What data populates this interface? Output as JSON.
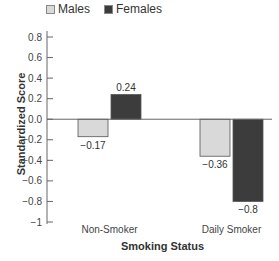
{
  "chart_data": {
    "type": "bar",
    "title": "",
    "xlabel": "Smoking Status",
    "ylabel": "Standardized Score",
    "categories": [
      "Non-Smoker",
      "Daily Smoker"
    ],
    "series": [
      {
        "name": "Males",
        "values": [
          -0.17,
          -0.36
        ],
        "color": "#d9d9d9"
      },
      {
        "name": "Females",
        "values": [
          0.24,
          -0.8
        ],
        "color": "#3c3c3c"
      }
    ],
    "value_labels": [
      [
        "−0.17",
        "0.24"
      ],
      [
        "−0.36",
        "−0.8"
      ]
    ],
    "ylim": [
      -1,
      0.8
    ],
    "yticks": [
      "0.8",
      "0.6",
      "0.4",
      "0.2",
      "0.0",
      "−0.2",
      "−0.4",
      "−0.6",
      "−0.8",
      "−1"
    ],
    "legend_position": "top",
    "grid": false
  },
  "legend": {
    "males": "Males",
    "females": "Females"
  },
  "axes": {
    "x_title": "Smoking Status",
    "y_title": "Standardized Score"
  }
}
